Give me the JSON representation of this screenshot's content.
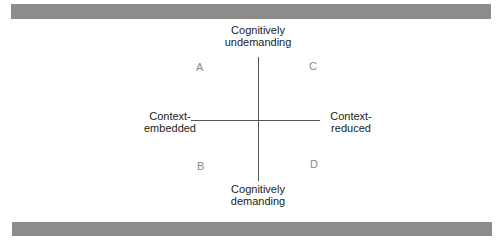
{
  "diagram": {
    "axes": {
      "vertical": {
        "top_label": [
          "Cognitively",
          "undemanding"
        ],
        "bottom_label": [
          "Cognitively",
          "demanding"
        ]
      },
      "horizontal": {
        "left_label": [
          "Context-",
          "embedded"
        ],
        "right_label": [
          "Context-",
          "reduced"
        ]
      }
    },
    "quadrants": {
      "top_left": "A",
      "top_right": "C",
      "bottom_left": "B",
      "bottom_right": "D"
    },
    "colors": {
      "bar": "#8c8c8c",
      "axis": "#555555",
      "quadrant_label": "#888888"
    }
  }
}
